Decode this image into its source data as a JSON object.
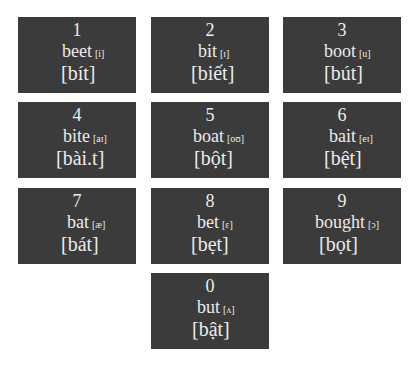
{
  "cards": [
    {
      "number": "1",
      "word": "beet",
      "ipa": "[i]",
      "vietnamese": "[bít]"
    },
    {
      "number": "2",
      "word": "bit",
      "ipa": "[ɪ]",
      "vietnamese": "[biết]"
    },
    {
      "number": "3",
      "word": "boot",
      "ipa": "[u]",
      "vietnamese": "[bút]"
    },
    {
      "number": "4",
      "word": "bite",
      "ipa": "[aɪ]",
      "vietnamese": "[bài.t]"
    },
    {
      "number": "5",
      "word": "boat",
      "ipa": "[oʊ]",
      "vietnamese": "[bột]"
    },
    {
      "number": "6",
      "word": "bait",
      "ipa": "[eɪ]",
      "vietnamese": "[bệt]"
    },
    {
      "number": "7",
      "word": "bat",
      "ipa": "[æ]",
      "vietnamese": "[bát]"
    },
    {
      "number": "8",
      "word": "bet",
      "ipa": "[ɛ]",
      "vietnamese": "[bẹt]"
    },
    {
      "number": "9",
      "word": "bought",
      "ipa": "[ɔ]",
      "vietnamese": "[bọt]"
    },
    {
      "number": "0",
      "word": "but",
      "ipa": "[ʌ]",
      "vietnamese": "[bật]"
    }
  ],
  "colors": {
    "card_background": "#3b3b3b",
    "card_text": "#ececec",
    "page_background": "#ffffff"
  }
}
